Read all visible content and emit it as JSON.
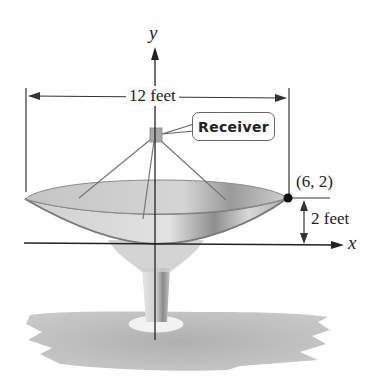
{
  "figure": {
    "axes": {
      "x_label": "x",
      "y_label": "y"
    },
    "dimensions": {
      "width_label": "12 feet",
      "depth_label": "2 feet"
    },
    "point": {
      "label": "(6, 2)",
      "x": 6,
      "y": 2
    },
    "callout": {
      "label": "Receiver"
    },
    "colors": {
      "lines": "#333333",
      "dish_fill": "#c9c9c9",
      "dish_edge": "#7a7a7a",
      "shadow": "#b8b8b8",
      "point": "#111111"
    }
  }
}
